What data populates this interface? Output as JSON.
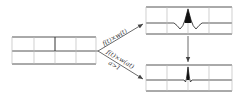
{
  "diagram": {
    "type": "wavelet-scaling",
    "colors": {
      "line": "#555555",
      "grid": "#bbbbbb",
      "fill": "#111111",
      "text": "#333333"
    },
    "panels": {
      "input": {
        "name": "input-signal-panel",
        "x": 12,
        "y": 37,
        "w": 84,
        "h": 27,
        "mid": 51,
        "dividers": [
          34,
          55,
          76
        ]
      },
      "top": {
        "name": "wavelet-output-panel",
        "x": 146,
        "y": 7,
        "w": 86,
        "h": 27,
        "mid": 23,
        "dividers": [
          167,
          188,
          209
        ]
      },
      "bottom": {
        "name": "scaled-wavelet-output-panel",
        "x": 146,
        "y": 65,
        "w": 86,
        "h": 26,
        "mid": 80,
        "dividers": [
          167,
          188,
          209
        ]
      }
    },
    "arrows": {
      "upper": {
        "label": "f(t)×w(t)"
      },
      "lower": {
        "label": "f(t)×w(at)",
        "condition": "a>1"
      }
    }
  }
}
